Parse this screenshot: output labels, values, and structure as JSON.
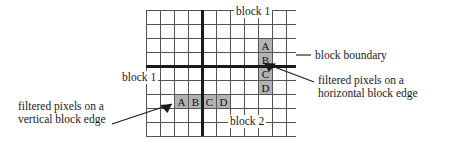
{
  "figure": {
    "type": "technical-diagram",
    "background_color": "#ffffff",
    "grid": {
      "line_color": "#555555",
      "thick_line_color": "#1a1a1a",
      "cell_size": 14,
      "left": 146,
      "top": 10,
      "columns": 10,
      "rows": 9,
      "vertical_boundary_column_index": 4,
      "horizontal_boundary_row_index": 4
    },
    "highlight": {
      "fill_color": "#b3b3b3",
      "border_color": "#555555"
    }
  },
  "labels": {
    "block1_top": "block 1",
    "block1_left": "block 1",
    "block2": "block 2",
    "block_boundary": "block boundary",
    "filtered_horizontal_line1": "filtered pixels on a",
    "filtered_horizontal_line2": "horizontal block edge",
    "filtered_vertical_line1": "filtered pixels on a",
    "filtered_vertical_line2": "vertical block edge"
  },
  "horizontal_edge_pixels": {
    "orientation": "vertical-stack",
    "letters": [
      "A",
      "B",
      "C",
      "D"
    ],
    "above_boundary": [
      "A",
      "B"
    ],
    "below_boundary": [
      "C",
      "D"
    ],
    "column_index": 6,
    "start_row_index": 2
  },
  "vertical_edge_pixels": {
    "orientation": "horizontal-run",
    "letters": [
      "A",
      "B",
      "C",
      "D"
    ],
    "left_of_boundary": [
      "A",
      "B"
    ],
    "right_of_boundary": [
      "C",
      "D"
    ],
    "row_index": 6,
    "start_column_index": 2
  }
}
